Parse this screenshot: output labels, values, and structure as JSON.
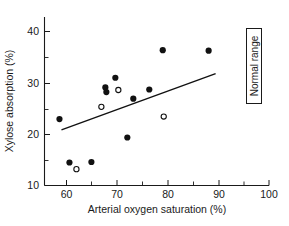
{
  "chart_data": {
    "type": "scatter",
    "title": "",
    "xlabel": "Arterial oxygen saturation (%)",
    "ylabel": "Xylose absorption (%)",
    "xlim": [
      55,
      100
    ],
    "ylim": [
      10,
      43
    ],
    "xticks": [
      60,
      70,
      80,
      90,
      100
    ],
    "xticklabels": [
      "60",
      "70",
      "80",
      "90",
      "100"
    ],
    "xminorticks": [
      65,
      75,
      85,
      95
    ],
    "yticks": [
      10,
      20,
      30,
      40
    ],
    "yticklabels": [
      "10",
      "20",
      "30",
      "40"
    ],
    "yminorticks": [
      15,
      25,
      35
    ],
    "grid": false,
    "legend_position": "none",
    "series": [
      {
        "name": "filled-markers",
        "marker": "filled-circle",
        "color": "#111111",
        "points": [
          {
            "x": 58.0,
            "y": 23.0
          },
          {
            "x": 60.0,
            "y": 14.5
          },
          {
            "x": 64.4,
            "y": 14.6
          },
          {
            "x": 67.2,
            "y": 29.2
          },
          {
            "x": 67.4,
            "y": 28.3
          },
          {
            "x": 69.2,
            "y": 31.1
          },
          {
            "x": 71.6,
            "y": 19.4
          },
          {
            "x": 72.8,
            "y": 27.0
          },
          {
            "x": 76.0,
            "y": 28.8
          },
          {
            "x": 78.7,
            "y": 36.5
          },
          {
            "x": 87.9,
            "y": 36.4
          }
        ]
      },
      {
        "name": "open-markers",
        "marker": "open-circle",
        "color": "#111111",
        "points": [
          {
            "x": 61.4,
            "y": 13.2
          },
          {
            "x": 66.4,
            "y": 25.4
          },
          {
            "x": 69.8,
            "y": 28.7
          },
          {
            "x": 78.9,
            "y": 23.5
          }
        ]
      }
    ],
    "trendline": {
      "name": "regression-line",
      "x0": 58.4,
      "y0": 20.9,
      "x1": 89.3,
      "y1": 31.9
    },
    "annotations": [
      {
        "name": "normal-range-box",
        "text": "Normal range",
        "orientation": "vertical"
      }
    ]
  },
  "colors": {
    "axis": "#1a1a1a",
    "marker_fill": "#111111",
    "marker_open_fill": "#ffffff",
    "trend": "#111111",
    "background": "#ffffff"
  }
}
